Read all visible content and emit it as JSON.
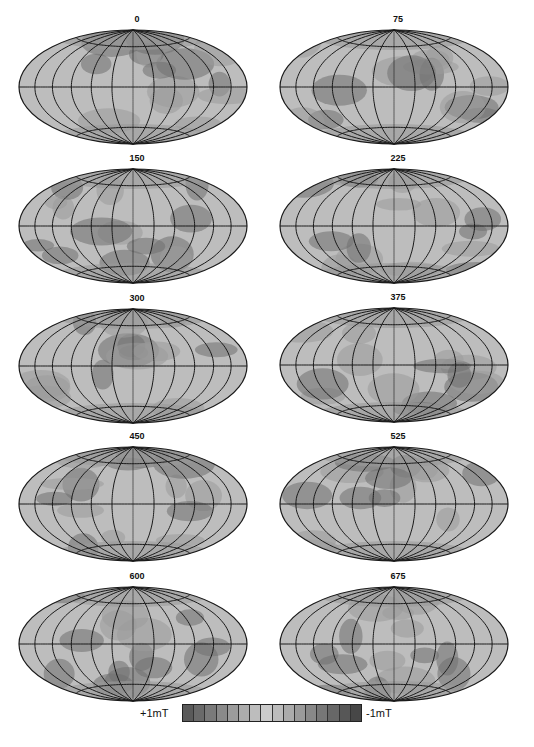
{
  "figure": {
    "type": "Hammer-Aitoff projection maps sequence",
    "panels": [
      {
        "label": "0"
      },
      {
        "label": "75"
      },
      {
        "label": "150"
      },
      {
        "label": "225"
      },
      {
        "label": "300"
      },
      {
        "label": "375"
      },
      {
        "label": "450"
      },
      {
        "label": "525"
      },
      {
        "label": "600"
      },
      {
        "label": "675"
      }
    ],
    "colorbar": {
      "left_label": "+1mT",
      "right_label": "-1mT",
      "cells": [
        "#5a5a5a",
        "#6a6a6a",
        "#7a7a7a",
        "#8a8a8a",
        "#9c9c9c",
        "#acacac",
        "#bdbdbd",
        "#cbcbcb",
        "#bcbcbc",
        "#ababab",
        "#9a9a9a",
        "#888888",
        "#777777",
        "#676767",
        "#575757",
        "#474747"
      ]
    },
    "colors": {
      "graticule": "#1a1a1a",
      "fill_light": "#bdbdbd",
      "fill_mid": "#9a9a9a",
      "fill_dark": "#707070"
    }
  }
}
